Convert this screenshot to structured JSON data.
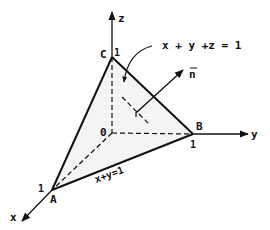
{
  "diagram": {
    "colors": {
      "ink": "#111111",
      "background": "#ffffff",
      "plane_shade": "#e6e6e6"
    },
    "axes": {
      "x": {
        "label": "x"
      },
      "y": {
        "label": "y"
      },
      "z": {
        "label": "z"
      }
    },
    "points": {
      "origin": {
        "label": "0"
      },
      "A": {
        "label": "A",
        "tick": "1"
      },
      "B": {
        "label": "B",
        "tick": "1"
      },
      "C": {
        "label": "C",
        "tick": "1"
      }
    },
    "annotations": {
      "plane_equation": "x + y +z =  1",
      "line_equation": "x+y=1",
      "normal_vector": "n"
    }
  }
}
